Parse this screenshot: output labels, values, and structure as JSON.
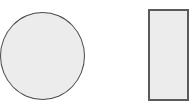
{
  "diagram": {
    "background": "#ffffff",
    "shapes": [
      {
        "kind": "circle",
        "name": "circle-shape",
        "left": 0,
        "top": 12,
        "width": 85,
        "height": 88,
        "fill": "#ececec",
        "stroke": "#4a4a4a",
        "stroke_width": 1.5
      },
      {
        "kind": "rectangle",
        "name": "rectangle-shape",
        "left": 148,
        "top": 9,
        "width": 41,
        "height": 92,
        "fill": "#ececec",
        "stroke": "#5a5a5a",
        "stroke_width": 2
      }
    ]
  }
}
